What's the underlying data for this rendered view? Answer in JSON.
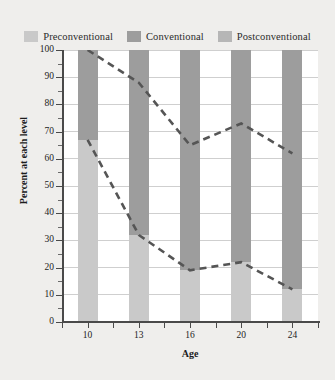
{
  "legend": {
    "position": "top-center",
    "entries": [
      {
        "label": "Preconventional",
        "color": "#c9c9c9",
        "icon": "legend-swatch-icon"
      },
      {
        "label": "Conventional",
        "color": "#9d9d9d",
        "icon": "legend-swatch-icon"
      },
      {
        "label": "Postconventional",
        "color": "#b6b6b6",
        "icon": "legend-swatch-icon"
      }
    ]
  },
  "axes": {
    "y_title": "Percent at each level",
    "x_title": "Age",
    "y_ticks": [
      "100",
      "90",
      "80",
      "70",
      "60",
      "50",
      "40",
      "30",
      "20",
      "10",
      "0"
    ],
    "x_ticks": [
      "10",
      "13",
      "16",
      "20",
      "24"
    ]
  },
  "chart_data": {
    "type": "bar",
    "title": "",
    "subtitle": "",
    "xlabel": "Age",
    "ylabel": "Percent at each level",
    "categories": [
      "10",
      "13",
      "16",
      "20",
      "24"
    ],
    "ylim": [
      0,
      100
    ],
    "xlim_note": "categorical age points 10, 13, 16, 20, 24",
    "grid": true,
    "grid_axis": "y",
    "grid_step": 10,
    "minor_tick_step": 5,
    "stacked": true,
    "series": [
      {
        "name": "Preconventional",
        "color": "#c9c9c9",
        "values": [
          67,
          32,
          19,
          22,
          12
        ]
      },
      {
        "name": "Conventional",
        "color": "#9d9d9d",
        "values": [
          33,
          68,
          81,
          78,
          88
        ]
      },
      {
        "name": "Postconventional",
        "color": "#b6b6b6",
        "values": [
          0,
          0,
          0,
          0,
          0
        ]
      }
    ],
    "annotations": [
      {
        "type": "dashed-line",
        "name": "conventional-trend-line",
        "style": "dashed",
        "color": "#555555",
        "x": [
          "10",
          "13",
          "16",
          "20",
          "24"
        ],
        "y": [
          100,
          88,
          65,
          73,
          62
        ]
      },
      {
        "type": "dashed-line",
        "name": "preconventional-boundary-line",
        "style": "dashed",
        "color": "#555555",
        "x": [
          "10",
          "13",
          "16",
          "20",
          "24"
        ],
        "y": [
          67,
          32,
          19,
          22,
          12
        ]
      }
    ],
    "legend_position": "top",
    "legend_entries": [
      "Preconventional",
      "Conventional",
      "Postconventional"
    ]
  },
  "colors": {
    "background": "#efeeec",
    "plot_background": "#ffffff",
    "axis": "#4a4a4a",
    "gridline": "#cfcfcf",
    "preconventional": "#c9c9c9",
    "conventional": "#9d9d9d",
    "postconventional": "#b6b6b6",
    "trend_line": "#555555"
  }
}
